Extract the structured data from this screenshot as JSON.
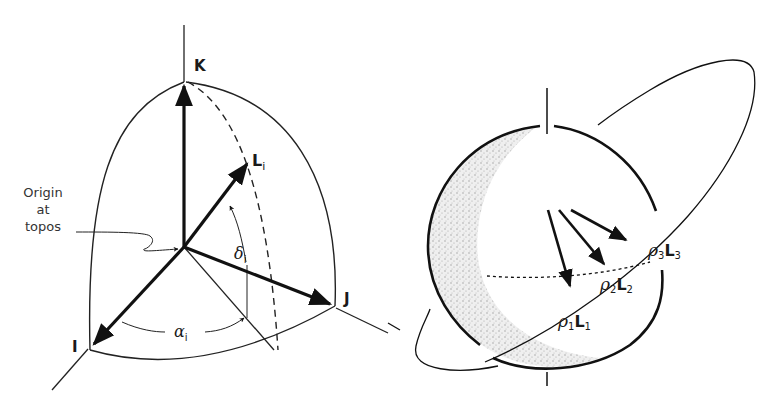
{
  "left_figure": {
    "axis_labels": {
      "k": "K",
      "j": "J",
      "i": "I"
    },
    "vector_label": {
      "main": "L",
      "sub": "i"
    },
    "declination": {
      "main": "δ",
      "sub": "i"
    },
    "right_ascension": {
      "main": "α",
      "sub": "i"
    },
    "origin_note": [
      "Origin",
      "at",
      "topos"
    ]
  },
  "right_figure": {
    "vectors": [
      {
        "rho": "ρ",
        "rho_sub": "1",
        "L": "L",
        "L_sub": "1"
      },
      {
        "rho": "ρ",
        "rho_sub": "2",
        "L": "L",
        "L_sub": "2"
      },
      {
        "rho": "ρ",
        "rho_sub": "3",
        "L": "L",
        "L_sub": "3"
      }
    ]
  }
}
